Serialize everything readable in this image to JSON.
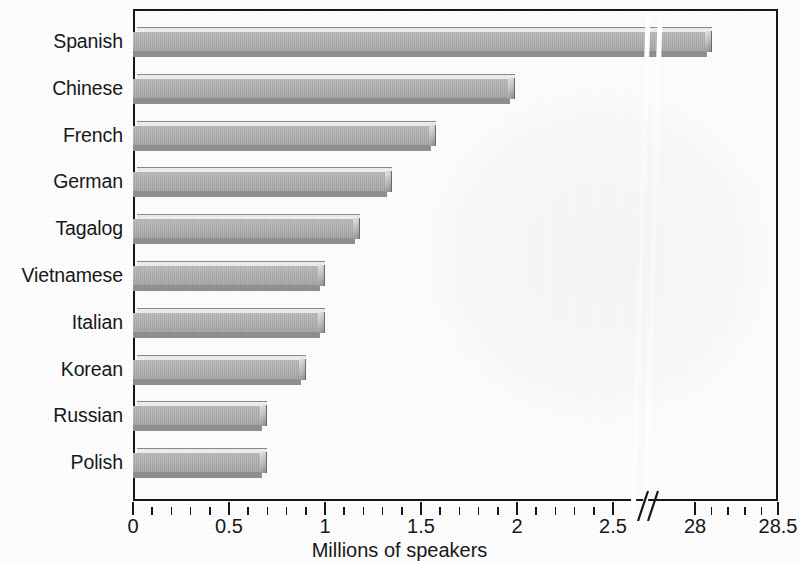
{
  "chart_data": {
    "type": "bar",
    "orientation": "horizontal",
    "title": "",
    "xlabel": "Millions of speakers",
    "ylabel": "",
    "categories": [
      "Spanish",
      "Chinese",
      "French",
      "German",
      "Tagalog",
      "Vietnamese",
      "Italian",
      "Korean",
      "Russian",
      "Polish"
    ],
    "values": [
      28.1,
      1.99,
      1.58,
      1.35,
      1.18,
      1.0,
      1.0,
      0.9,
      0.7,
      0.7
    ],
    "series": [
      {
        "name": "Millions of speakers",
        "values": [
          28.1,
          1.99,
          1.58,
          1.35,
          1.18,
          1.0,
          1.0,
          0.9,
          0.7,
          0.7
        ]
      }
    ],
    "x_tick_labels": [
      "0",
      "0.5",
      "1",
      "1.5",
      "2",
      "2.5",
      "28",
      "28.5"
    ],
    "x_tick_values": [
      0,
      0.5,
      1,
      1.5,
      2,
      2.5,
      28,
      28.5
    ],
    "xlim": [
      0,
      28.5
    ],
    "axis_break": {
      "present": true,
      "between": [
        2.5,
        28
      ],
      "style": "double-slash"
    },
    "minor_tick_step": 0.1,
    "grid": false,
    "legend": null,
    "bar_color": "#a8a8a8",
    "bar_edge_color": "#6e6e6e",
    "axis_color": "#15181a",
    "background_color": "#fcfcfc"
  },
  "axis": {
    "x_title": "Millions of speakers"
  }
}
